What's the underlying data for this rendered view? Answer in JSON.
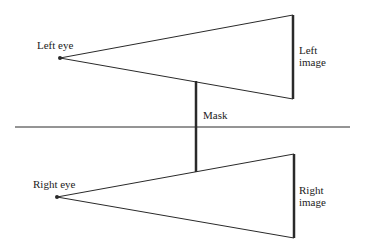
{
  "diagram": {
    "labels": {
      "left_eye": "Left eye",
      "right_eye": "Right eye",
      "left_image_line1": "Left",
      "left_image_line2": "image",
      "right_image_line1": "Right",
      "right_image_line2": "image",
      "mask": "Mask"
    },
    "colors": {
      "line": "#2a2a2a",
      "background": "#ffffff"
    }
  }
}
